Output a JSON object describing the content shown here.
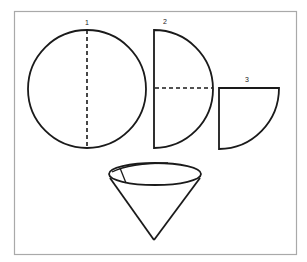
{
  "figure": {
    "frame_color": "#a9a9a9",
    "stroke_color": "#1a1a1a",
    "steps": [
      {
        "label": "1",
        "shape": "circle",
        "note": "full circle with vertical dashed fold line"
      },
      {
        "label": "2",
        "shape": "semicircle",
        "note": "circle folded in half, horizontal dashed fold line"
      },
      {
        "label": "3",
        "shape": "quarter-circle",
        "note": "folded again into a quarter"
      }
    ],
    "result": {
      "shape": "cone",
      "note": "quarter opened into a cone"
    }
  }
}
